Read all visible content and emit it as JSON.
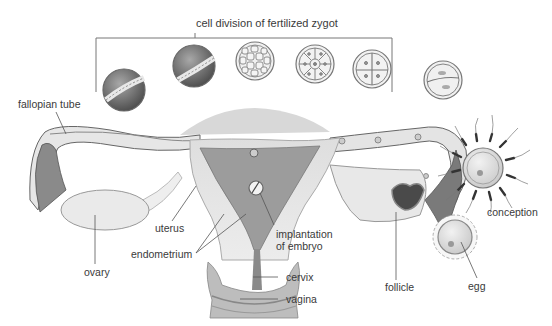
{
  "diagram": {
    "title": "cell division of fertilized zygot",
    "labels": {
      "fallopian_tube": "fallopian tube",
      "uterus": "uterus",
      "endometrium": "endometrium",
      "implantation_line1": "implantation",
      "implantation_line2": "of embryo",
      "ovary": "ovary",
      "cervix": "cervix",
      "vagina": "vagina",
      "follicle": "follicle",
      "egg": "egg",
      "conception": "conception"
    },
    "zygote_stages": [
      {
        "stage": "blastocyst-hatching",
        "order": 1
      },
      {
        "stage": "blastocyst",
        "order": 2
      },
      {
        "stage": "morula",
        "order": 3
      },
      {
        "stage": "8-cell",
        "order": 4
      },
      {
        "stage": "4-cell",
        "order": 5
      },
      {
        "stage": "2-cell",
        "order": 6
      }
    ],
    "colors": {
      "line": "#555555",
      "tissue_light": "#e4e4e4",
      "tissue_mid": "#bdbdbd",
      "tissue_dark": "#6a6a6a",
      "text": "#3a3a3a"
    }
  }
}
